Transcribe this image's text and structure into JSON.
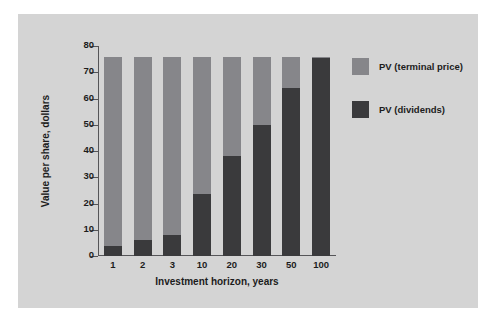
{
  "chart_data": {
    "type": "bar",
    "stacked": true,
    "title": "",
    "xlabel": "Investment horizon, years",
    "ylabel": "Value per share, dollars",
    "categories": [
      "1",
      "2",
      "3",
      "10",
      "20",
      "30",
      "50",
      "100"
    ],
    "ylim": [
      0,
      80
    ],
    "yticks": [
      0,
      10,
      20,
      30,
      40,
      50,
      60,
      70,
      80
    ],
    "grid": false,
    "legend_position": "right",
    "series": [
      {
        "name": "PV (dividends)",
        "color": "#3a3a3c",
        "values": [
          4,
          6,
          8,
          23.5,
          38,
          50,
          64,
          75.5
        ]
      },
      {
        "name": "PV (terminal price)",
        "color": "#86868a",
        "values": [
          72,
          70,
          68,
          52.5,
          38,
          26,
          12,
          0.5
        ]
      }
    ],
    "totals": [
      76,
      76,
      76,
      76,
      76,
      76,
      76,
      76
    ]
  },
  "legend": {
    "items": [
      {
        "label": "PV (terminal price)",
        "color": "#86868a"
      },
      {
        "label": "PV (dividends)",
        "color": "#3a3a3c"
      }
    ]
  },
  "colors": {
    "figure_background": "#d4d4d4",
    "page_background": "#ffffff",
    "axis": "#555558",
    "text": "#1c1c1c"
  }
}
